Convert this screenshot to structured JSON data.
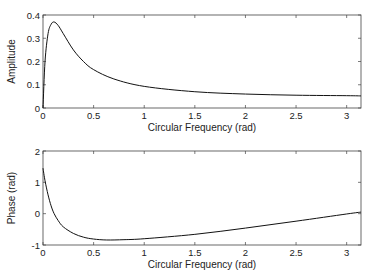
{
  "chart_data": [
    {
      "type": "line",
      "title": "",
      "xlabel": "Circular Frequency (rad)",
      "ylabel": "Amplitude",
      "xlim": [
        0,
        3.1416
      ],
      "ylim": [
        0,
        0.4
      ],
      "grid": false,
      "xticks": [
        "0",
        "0.5",
        "1",
        "1.5",
        "2",
        "2.5",
        "3"
      ],
      "yticks": [
        "0",
        "0.1",
        "0.2",
        "0.3",
        "0.4"
      ],
      "x": [
        0,
        0.02,
        0.05,
        0.08,
        0.11,
        0.15,
        0.2,
        0.3,
        0.4,
        0.5,
        0.7,
        1.0,
        1.5,
        2.0,
        2.5,
        3.0,
        3.1416
      ],
      "values": [
        0,
        0.2,
        0.32,
        0.36,
        0.37,
        0.355,
        0.32,
        0.25,
        0.2,
        0.165,
        0.125,
        0.093,
        0.07,
        0.06,
        0.055,
        0.053,
        0.052
      ]
    },
    {
      "type": "line",
      "title": "",
      "xlabel": "Circular Frequency (rad)",
      "ylabel": "Phase (rad)",
      "xlim": [
        0,
        3.1416
      ],
      "ylim": [
        -1,
        2
      ],
      "grid": false,
      "xticks": [
        "0",
        "0.5",
        "1",
        "1.5",
        "2",
        "2.5",
        "3"
      ],
      "yticks": [
        "-1",
        "0",
        "1",
        "2"
      ],
      "x": [
        0,
        0.02,
        0.05,
        0.08,
        0.11,
        0.15,
        0.2,
        0.3,
        0.4,
        0.5,
        0.63,
        0.8,
        1.0,
        1.5,
        2.0,
        2.5,
        3.0,
        3.1416
      ],
      "values": [
        1.45,
        1.05,
        0.6,
        0.25,
        0.0,
        -0.22,
        -0.42,
        -0.63,
        -0.75,
        -0.81,
        -0.84,
        -0.83,
        -0.8,
        -0.66,
        -0.46,
        -0.24,
        -0.01,
        0.05
      ]
    }
  ]
}
